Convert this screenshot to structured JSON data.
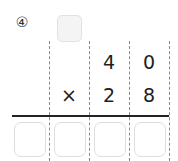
{
  "problem": {
    "number_label": "④",
    "carry_box_value": "",
    "multiplicand": [
      "",
      "",
      "4",
      "0"
    ],
    "multiplier_row": [
      "",
      "×",
      "2",
      "8"
    ],
    "answer_boxes": [
      "",
      "",
      "",
      ""
    ]
  },
  "colors": {
    "carry_box_fill": "#f4f4f4",
    "box_border": "#dedede",
    "result_line": "#222222",
    "column_divider": "#8a8a8a"
  }
}
